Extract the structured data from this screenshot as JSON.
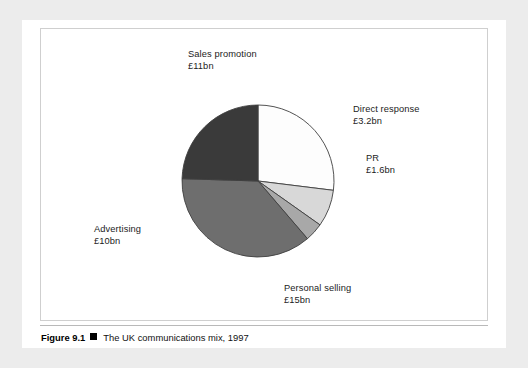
{
  "figure": {
    "caption_number": "Figure 9.1",
    "caption_marker": "square-bullet",
    "caption_text": "The UK communications mix, 1997"
  },
  "colors": {
    "page_background": "#ececec",
    "panel_background": "#ffffff",
    "text": "#1c1c1c",
    "slice_sales_promotion": "#fdfdfd",
    "slice_direct_response": "#d8d8d8",
    "slice_pr": "#a8a8a8",
    "slice_personal_selling": "#6e6e6e",
    "slice_advertising": "#3a3a3a",
    "slice_outline": "#3f3f3f",
    "caption_rule": "#b9b9b9"
  },
  "labels": {
    "sales_promotion": {
      "name": "Sales promotion",
      "value": "£11bn"
    },
    "direct_response": {
      "name": "Direct response",
      "value": "£3.2bn"
    },
    "pr": {
      "name": "PR",
      "value": "£1.6bn"
    },
    "advertising": {
      "name": "Advertising",
      "value": "£10bn"
    },
    "personal_selling": {
      "name": "Personal selling",
      "value": "£15bn"
    }
  },
  "chart_data": {
    "type": "pie",
    "title": "The UK communications mix, 1997",
    "unit": "£bn",
    "total": 40.8,
    "legend_position": "outside-callout-labels",
    "start_angle_deg": -90,
    "direction": "clockwise",
    "center_px": [
      258,
      181
    ],
    "radius_px": 76,
    "categories": [
      "Sales promotion",
      "Direct response",
      "PR",
      "Personal selling",
      "Advertising"
    ],
    "values": [
      11,
      3.2,
      1.6,
      15,
      10
    ],
    "value_labels": [
      "£11bn",
      "£3.2bn",
      "£1.6bn",
      "£15bn",
      "£10bn"
    ],
    "percentages": [
      26.96,
      7.84,
      3.92,
      36.76,
      24.51
    ],
    "angles_deg": [
      97.06,
      28.24,
      14.12,
      132.35,
      88.24
    ],
    "slice_colors": [
      "#fdfdfd",
      "#d8d8d8",
      "#a8a8a8",
      "#6e6e6e",
      "#3a3a3a"
    ],
    "grid": false
  }
}
